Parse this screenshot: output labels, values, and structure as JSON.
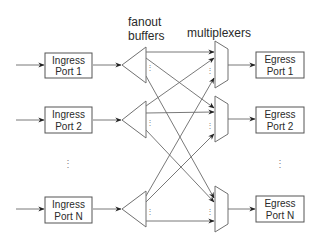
{
  "headers": {
    "fanout": "fanout",
    "buffers": "buffers",
    "multiplexers": "multiplexers"
  },
  "ingress": [
    {
      "line1": "Ingress",
      "line2": "Port 1"
    },
    {
      "line1": "Ingress",
      "line2": "Port 2"
    },
    {
      "line1": "Ingress",
      "line2": "Port N"
    }
  ],
  "egress": [
    {
      "line1": "Egress",
      "line2": "Port 1"
    },
    {
      "line1": "Egress",
      "line2": "Port 2"
    },
    {
      "line1": "Egress",
      "line2": "Port N"
    }
  ],
  "ellipsis": "⋮",
  "colors": {
    "stroke": "#555555",
    "wire": "#6a6a6a",
    "text": "#2a2a2a",
    "background": "#ffffff"
  }
}
